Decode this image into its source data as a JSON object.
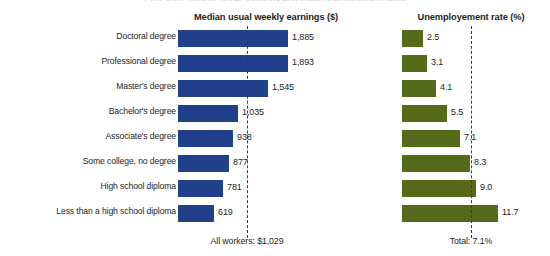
{
  "figure": {
    "supertitle": "Education pays in higher earnings and lower unemployment rates",
    "width": 550,
    "height": 256
  },
  "panels": {
    "earnings": {
      "title": "Median usual weekly earnings ($)",
      "footer": "All workers: $1,029",
      "reference_value": 1029,
      "color": "#20408C",
      "bar_origin_px": 178,
      "px_per_unit": 0.0582
    },
    "unemployment": {
      "title": "Unemployement rate (%)",
      "footer": "Total: 7.1%",
      "reference_value": 7.1,
      "color": "#556B1A",
      "bar_origin_px": 402,
      "px_per_unit": 8.2
    }
  },
  "chart_data": {
    "type": "bar",
    "orientation": "horizontal",
    "title": "Education pays in higher earnings and lower unemployment rates",
    "categories": [
      "Doctoral degree",
      "Professional degree",
      "Master's degree",
      "Bachelor's degree",
      "Associate's degree",
      "Some college, no degree",
      "High school diploma",
      "Less than a high school diploma"
    ],
    "series": [
      {
        "name": "Median usual weekly earnings ($)",
        "color": "#20408C",
        "values": [
          1885,
          1893,
          1545,
          1035,
          938,
          877,
          781,
          619
        ],
        "labels": [
          "1,885",
          "1,893",
          "1,545",
          "1,035",
          "938",
          "877",
          "781",
          "619"
        ],
        "reference_line": {
          "value": 1029,
          "label": "All workers: $1,029"
        },
        "xlim": [
          0,
          2000
        ]
      },
      {
        "name": "Unemployement rate (%)",
        "color": "#556B1A",
        "values": [
          2.5,
          3.1,
          4.1,
          5.5,
          7.1,
          8.3,
          9.0,
          11.7
        ],
        "labels": [
          "2.5",
          "3.1",
          "4.1",
          "5.5",
          "7.1",
          "8.3",
          "9.0",
          "11.7"
        ],
        "reference_line": {
          "value": 7.1,
          "label": "Total: 7.1%"
        },
        "xlim": [
          0,
          13
        ]
      }
    ],
    "xlabel": "",
    "ylabel": "",
    "grid": false,
    "legend": "none"
  }
}
